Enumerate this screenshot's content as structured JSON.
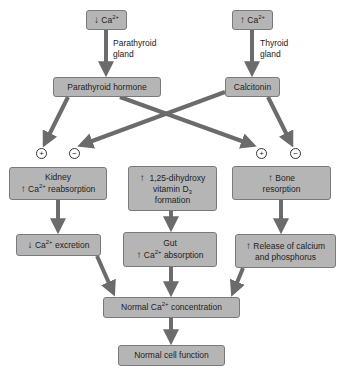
{
  "diagram": {
    "nodes": {
      "low_ca": {
        "arrow": "↓",
        "text": "Ca",
        "sup": "2+"
      },
      "high_ca": {
        "arrow": "↑",
        "text": "Ca",
        "sup": "2+"
      },
      "pth": {
        "text": "Parathyroid hormone"
      },
      "calcitonin": {
        "text": "Calcitonin"
      },
      "kidney": {
        "line1": "Kidney",
        "arrow": "↑",
        "text": "Ca",
        "sup": "2+",
        "rest": " reabsorption"
      },
      "vitd": {
        "arrow": "↑",
        "line1": "1,25-dihydroxy",
        "line2_pre": "vitamin D",
        "line2_sub": "3",
        "line3": "formation"
      },
      "bone": {
        "arrow": "↑",
        "line1": "Bone",
        "line2": "resorption"
      },
      "excretion": {
        "arrow": "↓",
        "text": "Ca",
        "sup": "2+",
        "rest": " excretion"
      },
      "gut": {
        "line1": "Gut",
        "arrow": "↑",
        "text": "Ca",
        "sup": "2+",
        "rest": " absorption"
      },
      "release": {
        "arrow": "↑",
        "line1": "Release of calcium",
        "line2": "and phosphorus"
      },
      "normal_ca": {
        "pre": "Normal Ca",
        "sup": "2+",
        "rest": " concentration"
      },
      "cell": {
        "text": "Normal cell function"
      }
    },
    "edge_labels": {
      "parathyroid_gland_1": "Parathyroid",
      "parathyroid_gland_2": "gland",
      "thyroid_gland_1": "Thyroid",
      "thyroid_gland_2": "gland"
    },
    "signs": {
      "kidney_plus": "+",
      "kidney_minus": "−",
      "bone_plus": "+",
      "bone_minus": "−"
    },
    "colors": {
      "box_fill": "#b5b5b5",
      "box_border": "#7a7a7a",
      "arrow": "#6b6b6b"
    }
  }
}
